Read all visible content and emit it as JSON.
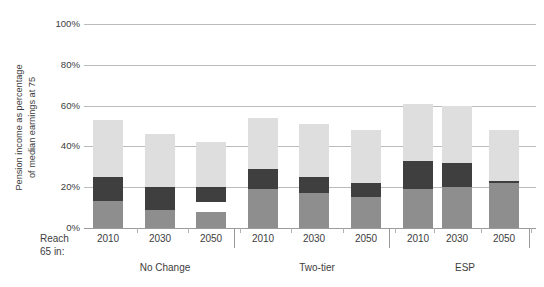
{
  "axis": {
    "y_title_line1": "Pension income as percentage",
    "y_title_line2": "of median earnings at 75",
    "reach_line1": "Reach",
    "reach_line2": "65 in:"
  },
  "chart_data": {
    "type": "bar",
    "title": "",
    "xlabel": "",
    "ylabel": "Pension income as percentage of median earnings at 75",
    "ylim": [
      0,
      100
    ],
    "ytick_labels": [
      "0%",
      "20%",
      "40%",
      "60%",
      "80%",
      "100%"
    ],
    "ytick_values": [
      0,
      20,
      40,
      60,
      80,
      100
    ],
    "grid": true,
    "stacked": true,
    "legend": "none",
    "groups": [
      "No Change",
      "Two-tier",
      "ESP"
    ],
    "categories": [
      "2010",
      "2030",
      "2050"
    ],
    "series": [
      {
        "name": "bottom-segment",
        "color": "#8e8e8e"
      },
      {
        "name": "middle-segment",
        "color": "#3f3f3f"
      },
      {
        "name": "top-segment",
        "color": "#dedede"
      }
    ],
    "bars": [
      {
        "group": "No Change",
        "year": "2010",
        "total": 53,
        "bottom_start": 0,
        "bottom_end": 13,
        "mid_start": 13,
        "mid_end": 25,
        "top_start": 25,
        "top_end": 53
      },
      {
        "group": "No Change",
        "year": "2030",
        "total": 46,
        "bottom_start": 0,
        "bottom_end": 9,
        "mid_start": 9,
        "mid_end": 20,
        "top_start": 20,
        "top_end": 46
      },
      {
        "group": "No Change",
        "year": "2050",
        "total": 42,
        "bottom_start": 0,
        "bottom_end": 8,
        "mid_start": 13,
        "mid_end": 20,
        "top_start": 20,
        "top_end": 42
      },
      {
        "group": "Two-tier",
        "year": "2010",
        "total": 54,
        "bottom_start": 0,
        "bottom_end": 19,
        "mid_start": 19,
        "mid_end": 29,
        "top_start": 29,
        "top_end": 54
      },
      {
        "group": "Two-tier",
        "year": "2030",
        "total": 51,
        "bottom_start": 0,
        "bottom_end": 17,
        "mid_start": 17,
        "mid_end": 25,
        "top_start": 25,
        "top_end": 51
      },
      {
        "group": "Two-tier",
        "year": "2050",
        "total": 48,
        "bottom_start": 0,
        "bottom_end": 15,
        "mid_start": 15,
        "mid_end": 22,
        "top_start": 22,
        "top_end": 48
      },
      {
        "group": "ESP",
        "year": "2010",
        "total": 61,
        "bottom_start": 0,
        "bottom_end": 19,
        "mid_start": 19,
        "mid_end": 33,
        "top_start": 33,
        "top_end": 61
      },
      {
        "group": "ESP",
        "year": "2030",
        "total": 60,
        "bottom_start": 0,
        "bottom_end": 20,
        "mid_start": 20,
        "mid_end": 32,
        "top_start": 32,
        "top_end": 60
      },
      {
        "group": "ESP",
        "year": "2050",
        "total": 48,
        "bottom_start": 0,
        "bottom_end": 22,
        "mid_start": 22,
        "mid_end": 23,
        "top_start": 23,
        "top_end": 48
      }
    ]
  },
  "colors": {
    "bottom": "#8e8e8e",
    "middle": "#3f3f3f",
    "top": "#dedede",
    "grid": "#b9bbbd",
    "text": "#3d3d3d",
    "background": "#ffffff"
  }
}
